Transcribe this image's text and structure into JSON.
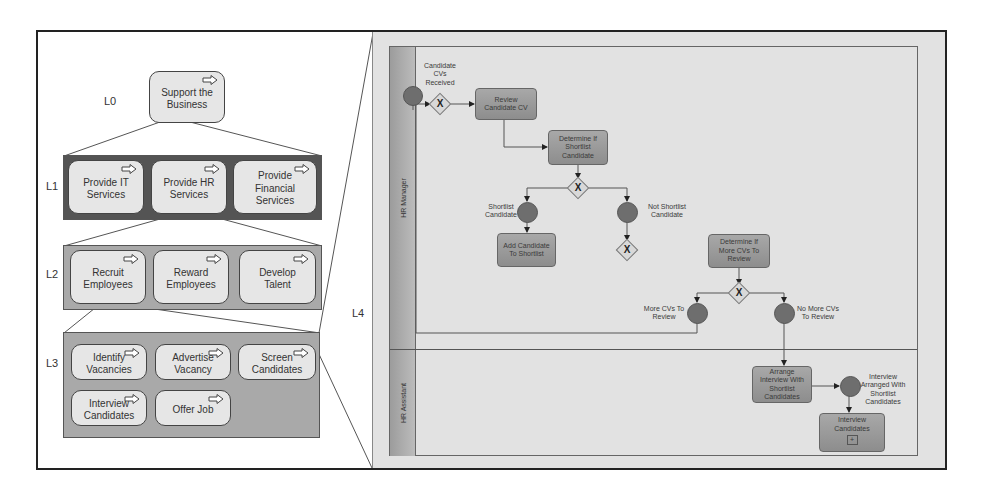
{
  "hierarchy": {
    "levels": [
      {
        "id": "L0",
        "label": "L0",
        "processes": [
          "Support the Business"
        ]
      },
      {
        "id": "L1",
        "label": "L1",
        "processes": [
          "Provide IT Services",
          "Provide HR Services",
          "Provide Financial Services"
        ]
      },
      {
        "id": "L2",
        "label": "L2",
        "processes": [
          "Recruit Employees",
          "Reward Employees",
          "Develop Talent"
        ]
      },
      {
        "id": "L3",
        "label": "L3",
        "processes": [
          "Identify Vacancies",
          "Advertise Vacancy",
          "Screen Candidates",
          "Interview Candidates",
          "Offer Job"
        ]
      },
      {
        "id": "L4",
        "label": "L4",
        "processes": []
      }
    ],
    "drilldown_path": [
      "Support the Business",
      "Provide HR Services",
      "Recruit Employees",
      "Screen Candidates"
    ]
  },
  "bpmn": {
    "lanes": [
      {
        "name": "HR Manager"
      },
      {
        "name": "HR Assistant"
      }
    ],
    "events": {
      "start": "Candidate CVs Received",
      "shortlist": "Shortlist Candidate",
      "not_shortlist": "Not Shortlist Candidate",
      "more_cvs": "More CVs To Review",
      "no_more_cvs": "No More CVs To Review",
      "interview_arranged": "Interview Arranged With Shortlist Candidates"
    },
    "tasks": {
      "review": "Review Candidate CV",
      "determine_shortlist": "Determine If Shortlist Candidate",
      "add_shortlist": "Add Candidate To Shortlist",
      "determine_more": "Determine If More CVs To Review",
      "arrange_interview": "Arrange Interview With Shortlist Candidates",
      "interview": "Interview Candidates"
    },
    "gateway_symbol": "X",
    "subprocess_marker": "+"
  }
}
